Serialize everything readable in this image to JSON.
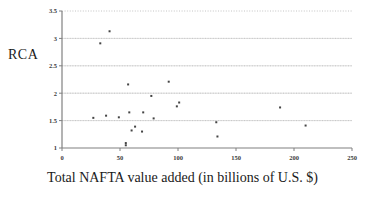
{
  "chart_data": {
    "type": "scatter",
    "title": "",
    "xlabel": "Total NAFTA value added (in billions of U.S. $)",
    "ylabel": "RCA",
    "xlim": [
      0,
      250
    ],
    "ylim": [
      1,
      3.5
    ],
    "xticks": [
      0,
      50,
      100,
      150,
      200,
      250
    ],
    "yticks": [
      1,
      1.5,
      2,
      2.5,
      3,
      3.5
    ],
    "xtick_labels": [
      "0",
      "50",
      "100",
      "150",
      "200",
      "250"
    ],
    "ytick_labels": [
      "1",
      "1.5",
      "2",
      "2.5",
      "3",
      "3.5"
    ],
    "grid": "horizontal-dotted",
    "legend": "none",
    "marker": "small-dark-square",
    "marker_color": "#444444",
    "points": [
      {
        "x": 41,
        "y": 3.13
      },
      {
        "x": 33,
        "y": 2.91
      },
      {
        "x": 92,
        "y": 2.21
      },
      {
        "x": 57,
        "y": 2.16
      },
      {
        "x": 77,
        "y": 1.95
      },
      {
        "x": 101,
        "y": 1.83
      },
      {
        "x": 99,
        "y": 1.76
      },
      {
        "x": 188,
        "y": 1.74
      },
      {
        "x": 58,
        "y": 1.65
      },
      {
        "x": 70,
        "y": 1.65
      },
      {
        "x": 38,
        "y": 1.59
      },
      {
        "x": 27,
        "y": 1.55
      },
      {
        "x": 49,
        "y": 1.56
      },
      {
        "x": 79,
        "y": 1.54
      },
      {
        "x": 133,
        "y": 1.47
      },
      {
        "x": 210,
        "y": 1.41
      },
      {
        "x": 63,
        "y": 1.39
      },
      {
        "x": 60,
        "y": 1.32
      },
      {
        "x": 69,
        "y": 1.3
      },
      {
        "x": 134,
        "y": 1.21
      },
      {
        "x": 55,
        "y": 1.09
      },
      {
        "x": 55,
        "y": 1.05
      }
    ]
  },
  "axis_colors": {
    "axis_line": "#808080",
    "gridline": "#b5b5b5",
    "tick_label": "#3a3a3a",
    "marker": "#444444",
    "background": "#ffffff"
  }
}
